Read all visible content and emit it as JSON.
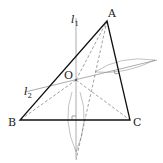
{
  "diagram": {
    "type": "geometry-construction",
    "labels": {
      "A": "A",
      "B": "B",
      "C": "C",
      "O": "O",
      "l1": "l",
      "l1_sub": "1",
      "l2": "l",
      "l2_sub": "2"
    },
    "points": {
      "A": [
        107,
        21
      ],
      "B": [
        20,
        120
      ],
      "C": [
        130,
        120
      ],
      "O": [
        76,
        80
      ]
    }
  }
}
